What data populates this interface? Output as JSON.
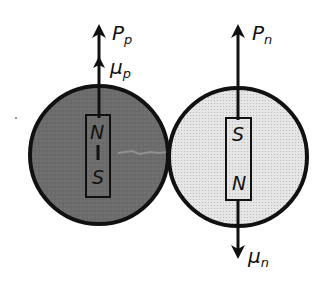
{
  "diagram": {
    "type": "nucleon magnetic moment diagram",
    "colors": {
      "proton_fill": "#6e6e6e",
      "neutron_fill": "#e2e2e2",
      "outline": "#111111",
      "background": "#ffffff"
    },
    "proton": {
      "spin_label": "P",
      "spin_sub": "p",
      "moment_label": "μ",
      "moment_sub": "p",
      "magnet_top": "N",
      "magnet_bottom": "S",
      "moment_direction": "up"
    },
    "neutron": {
      "spin_label": "P",
      "spin_sub": "n",
      "moment_label": "μ",
      "moment_sub": "n",
      "magnet_top": "S",
      "magnet_bottom": "N",
      "moment_direction": "down"
    }
  }
}
